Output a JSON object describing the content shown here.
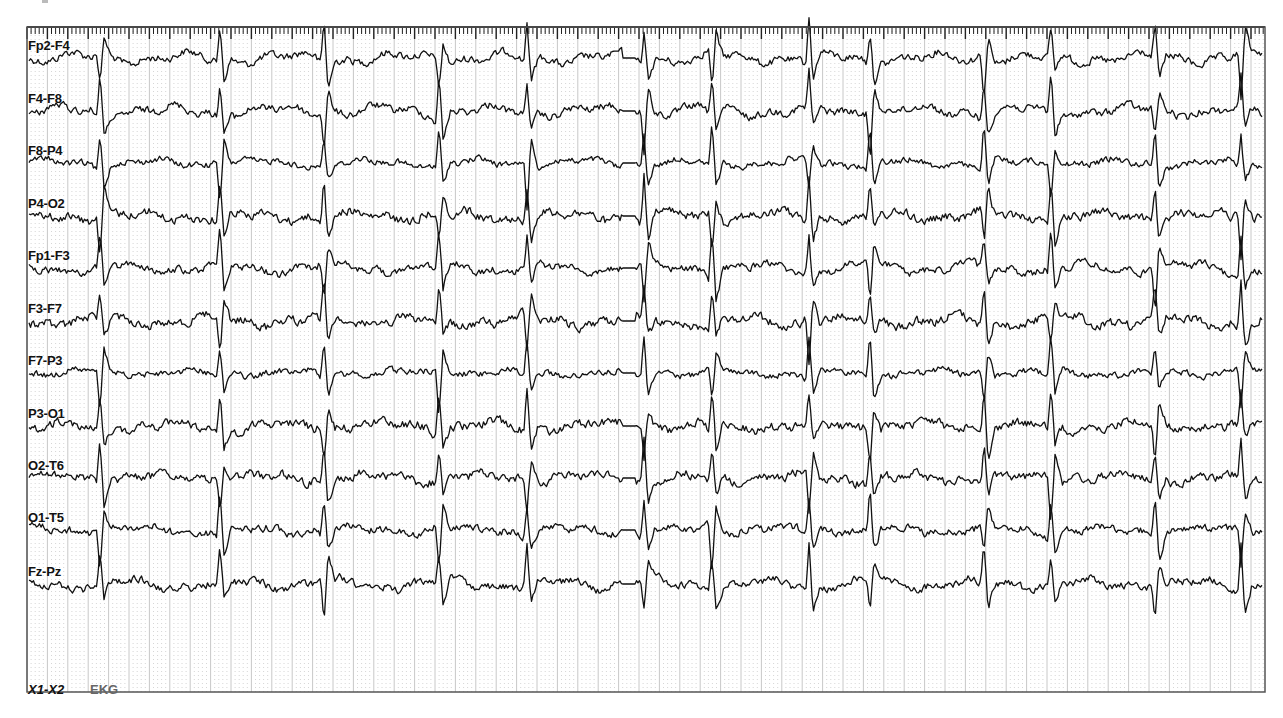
{
  "viewer": {
    "plot": {
      "left": 27,
      "top": 27,
      "right": 1265,
      "bottom": 692
    },
    "colors": {
      "trace": "#111111",
      "frame": "#555555",
      "major_grid": "#c8c8c8",
      "minor_grid": "#d6d6d6",
      "ruler_tick": "#222222",
      "label": "#111111",
      "ekg_label": "#666666"
    },
    "grid": {
      "major_spacing_px": 20.4,
      "minor_per_major": 5
    },
    "ruler": {
      "minor_tick_px": 4.08,
      "major_every": 5
    }
  },
  "montage": {
    "channels": [
      {
        "label": "Fp2-F4",
        "baseline_y": 58,
        "amp": 7,
        "noise": 6
      },
      {
        "label": "F4-F8",
        "baseline_y": 111,
        "amp": 7,
        "noise": 6
      },
      {
        "label": "F8-P4",
        "baseline_y": 163,
        "amp": 5,
        "noise": 5
      },
      {
        "label": "P4-O2",
        "baseline_y": 216,
        "amp": 6,
        "noise": 7
      },
      {
        "label": "Fp1-F3",
        "baseline_y": 268,
        "amp": 7,
        "noise": 6
      },
      {
        "label": "F3-F7",
        "baseline_y": 321,
        "amp": 7,
        "noise": 7
      },
      {
        "label": "F7-P3",
        "baseline_y": 373,
        "amp": 4,
        "noise": 5
      },
      {
        "label": "P3-O1",
        "baseline_y": 426,
        "amp": 6,
        "noise": 7
      },
      {
        "label": "O2-T6",
        "baseline_y": 478,
        "amp": 6,
        "noise": 7
      },
      {
        "label": "O1-T5",
        "baseline_y": 530,
        "amp": 5,
        "noise": 6
      },
      {
        "label": "Fz-Pz",
        "baseline_y": 584,
        "amp": 7,
        "noise": 6
      }
    ],
    "ekg": {
      "reference": "X1-X2",
      "name": "EKG",
      "baseline_y": 640
    }
  },
  "events": {
    "spike_x": [
      97,
      217,
      321,
      436,
      524,
      641,
      709,
      806,
      867,
      981,
      1048,
      1152,
      1238
    ],
    "flat_segment": {
      "x_start": 622,
      "x_end": 636
    }
  }
}
